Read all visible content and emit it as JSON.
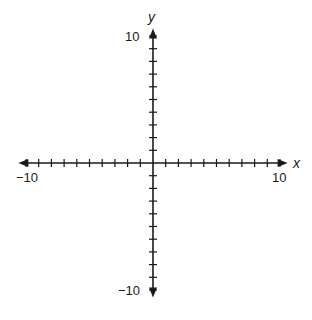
{
  "chart_data": {
    "type": "scatter",
    "title": "",
    "xlabel": "x",
    "ylabel": "y",
    "xlim": [
      -10,
      10
    ],
    "ylim": [
      -10,
      10
    ],
    "x_tick_step": 1,
    "y_tick_step": 1,
    "tick_labels": {
      "x_min": "−10",
      "x_max": "10",
      "y_min": "−10",
      "y_max": "10"
    },
    "grid": false,
    "legend": null,
    "series": [],
    "arrows_on_axes": true
  },
  "colors": {
    "axis": "#1a1a1a",
    "background": "#ffffff"
  }
}
